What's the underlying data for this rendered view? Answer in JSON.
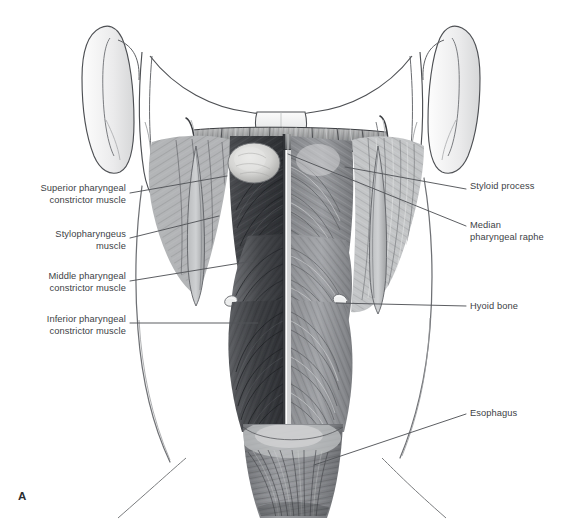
{
  "figure": {
    "panel_letter": "A",
    "background_color": "#ffffff",
    "text_color": "#404246",
    "leader_line_color": "#53555a"
  },
  "labels_left": [
    {
      "id": "superior-pharyngeal-constrictor-muscle",
      "text": "Superior pharyngeal\nconstrictor muscle",
      "x": 14,
      "y": 183,
      "width": 112,
      "leader": {
        "x1": 130,
        "y1": 193,
        "x2": 227,
        "y2": 176
      }
    },
    {
      "id": "stylopharyngeus-muscle",
      "text": "Stylopharyngeus\nmuscle",
      "x": 24,
      "y": 229,
      "width": 102,
      "leader": {
        "x1": 130,
        "y1": 238,
        "x2": 219,
        "y2": 216
      }
    },
    {
      "id": "middle-pharyngeal-constrictor-muscle",
      "text": "Middle pharyngeal\nconstrictor muscle",
      "x": 14,
      "y": 271,
      "width": 112,
      "leader": {
        "x1": 130,
        "y1": 281,
        "x2": 253,
        "y2": 261
      }
    },
    {
      "id": "inferior-pharyngeal-constrictor-muscle",
      "text": "Inferior pharyngeal\nconstrictor muscle",
      "x": 14,
      "y": 314,
      "width": 112,
      "leader": {
        "x1": 130,
        "y1": 323,
        "x2": 258,
        "y2": 323
      }
    }
  ],
  "labels_right": [
    {
      "id": "styloid-process",
      "text": "Styloid process",
      "x": 470,
      "y": 181,
      "width": 86,
      "leader": {
        "x1": 466,
        "y1": 189,
        "x2": 345,
        "y2": 167
      }
    },
    {
      "id": "median-pharyngeal-raphe",
      "text": "Median\npharyngeal raphe",
      "x": 470,
      "y": 220,
      "width": 88,
      "leader": {
        "x1": 466,
        "y1": 226,
        "x2": 288,
        "y2": 154
      }
    },
    {
      "id": "hyoid-bone",
      "text": "Hyoid bone",
      "x": 470,
      "y": 301,
      "width": 68,
      "leader": {
        "x1": 466,
        "y1": 306,
        "x2": 336,
        "y2": 303
      }
    },
    {
      "id": "esophagus",
      "text": "Esophagus",
      "x": 470,
      "y": 408,
      "width": 66,
      "leader": {
        "x1": 466,
        "y1": 414,
        "x2": 314,
        "y2": 465
      }
    }
  ],
  "anatomy_regions": [
    {
      "id": "left-auricle",
      "name": "ear-auricle-left"
    },
    {
      "id": "right-auricle",
      "name": "ear-auricle-right"
    },
    {
      "id": "left-mandible-ramus",
      "name": "mandible-ramus-left"
    },
    {
      "id": "right-mandible-ramus",
      "name": "mandible-ramus-right"
    },
    {
      "id": "skull-base",
      "name": "skull-base-occipital"
    },
    {
      "id": "pharyngeal-tubercle",
      "name": "pharyngeal-tubercle"
    },
    {
      "id": "superior-constrictor",
      "name": "superior-constrictor-muscle-body"
    },
    {
      "id": "middle-constrictor",
      "name": "middle-constrictor-muscle-body"
    },
    {
      "id": "inferior-constrictor",
      "name": "inferior-constrictor-muscle-body"
    },
    {
      "id": "median-raphe",
      "name": "median-pharyngeal-raphe-line"
    },
    {
      "id": "esophagus-tube",
      "name": "esophagus-tube"
    },
    {
      "id": "hyoid-left",
      "name": "hyoid-bone-left-horn"
    },
    {
      "id": "hyoid-right",
      "name": "hyoid-bone-right-horn"
    },
    {
      "id": "styloid-left",
      "name": "styloid-process-left"
    },
    {
      "id": "styloid-right",
      "name": "styloid-process-right"
    },
    {
      "id": "neck-contour-left",
      "name": "neck-contour-left"
    },
    {
      "id": "neck-contour-right",
      "name": "neck-contour-right"
    }
  ]
}
